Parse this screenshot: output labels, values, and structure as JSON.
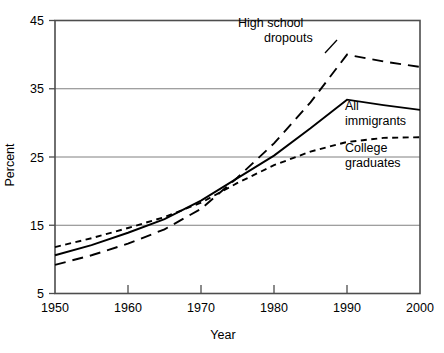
{
  "chart_data": {
    "type": "line",
    "title": "",
    "xlabel": "Year",
    "ylabel": "Percent",
    "xlim": [
      1950,
      2000
    ],
    "ylim": [
      5,
      45
    ],
    "xticks": [
      1950,
      1960,
      1970,
      1980,
      1990,
      2000
    ],
    "yticks": [
      5,
      15,
      25,
      35,
      45
    ],
    "xtick_labels": [
      "1950",
      "1960",
      "1970",
      "1980",
      "1990",
      "2000"
    ],
    "ytick_labels": [
      "5",
      "15",
      "25",
      "35",
      "45"
    ],
    "grid": "horizontal",
    "legend_position": "inline-annotations",
    "x": [
      1950,
      1955,
      1960,
      1965,
      1970,
      1975,
      1980,
      1985,
      1990,
      1995,
      2000
    ],
    "series": [
      {
        "name": "High school dropouts",
        "style": "long-dash",
        "values": [
          9.2,
          10.6,
          12.3,
          14.4,
          17.4,
          22.0,
          27.0,
          33.0,
          40.0,
          39.0,
          38.2
        ]
      },
      {
        "name": "All immigrants",
        "style": "solid",
        "values": [
          10.6,
          12.1,
          13.9,
          15.9,
          18.6,
          21.9,
          25.2,
          29.2,
          33.4,
          32.6,
          31.9
        ]
      },
      {
        "name": "College graduates",
        "style": "short-dash",
        "values": [
          11.8,
          13.1,
          14.6,
          16.2,
          18.3,
          21.2,
          23.8,
          25.8,
          27.2,
          27.8,
          27.9
        ]
      }
    ],
    "annotations": [
      {
        "text_line1": "High school",
        "text_line2": "dropouts",
        "series": "High school dropouts"
      },
      {
        "text_line1": "All",
        "text_line2": "immigrants",
        "series": "All immigrants"
      },
      {
        "text_line1": "College",
        "text_line2": "graduates",
        "series": "College graduates"
      }
    ]
  },
  "labels": {
    "y_axis_title": "Percent",
    "x_axis_title": "Year",
    "ytick_0": "5",
    "ytick_1": "15",
    "ytick_2": "25",
    "ytick_3": "35",
    "ytick_4": "45",
    "xtick_0": "1950",
    "xtick_1": "1960",
    "xtick_2": "1970",
    "xtick_3": "1980",
    "xtick_4": "1990",
    "xtick_5": "2000",
    "ann_dropouts_l1": "High school",
    "ann_dropouts_l2": "dropouts",
    "ann_all_l1": "All",
    "ann_all_l2": "immigrants",
    "ann_college_l1": "College",
    "ann_college_l2": "graduates"
  }
}
